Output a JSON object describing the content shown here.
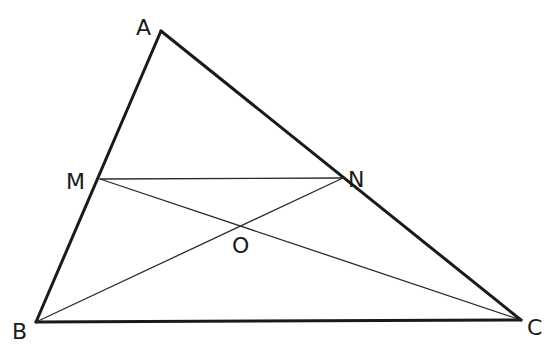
{
  "diagram": {
    "type": "geometry-triangle-midsegment",
    "colors": {
      "background": "#ffffff",
      "stroke": "#1a1a1a"
    },
    "points": {
      "A": {
        "label": "A",
        "x": 161,
        "y": 31,
        "lx": 136,
        "ly": 35
      },
      "M": {
        "label": "M",
        "x": 100,
        "y": 179,
        "lx": 66,
        "ly": 189
      },
      "N": {
        "label": "N",
        "x": 343,
        "y": 178,
        "lx": 348,
        "ly": 187
      },
      "O": {
        "label": "O",
        "x": 241,
        "y": 222,
        "lx": 232,
        "ly": 253
      },
      "B": {
        "label": "B",
        "x": 36,
        "y": 322,
        "lx": 12,
        "ly": 339
      },
      "C": {
        "label": "C",
        "x": 521,
        "y": 320,
        "lx": 527,
        "ly": 335
      }
    },
    "segments": [
      {
        "from": "A",
        "to": "B",
        "weight": "thick"
      },
      {
        "from": "A",
        "to": "C",
        "weight": "thick"
      },
      {
        "from": "B",
        "to": "C",
        "weight": "thick"
      },
      {
        "from": "M",
        "to": "N",
        "weight": "thin"
      },
      {
        "from": "M",
        "to": "C",
        "weight": "thin"
      },
      {
        "from": "B",
        "to": "N",
        "weight": "thin"
      }
    ]
  }
}
